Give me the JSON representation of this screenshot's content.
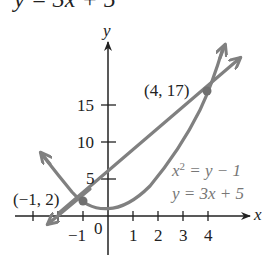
{
  "header": {
    "equation_cropped": "y = 3x + 5"
  },
  "graph": {
    "axes": {
      "x_label": "x",
      "y_label": "y",
      "x_ticks": [
        "-1",
        "0",
        "1",
        "2",
        "3",
        "4"
      ],
      "y_ticks": [
        "5",
        "10",
        "15"
      ]
    },
    "points": [
      {
        "label": "(4, 17)",
        "x": 4,
        "y": 17
      },
      {
        "label": "(−1, 2)",
        "x": -1,
        "y": 2
      }
    ],
    "legend": {
      "eq1": "x² = y − 1",
      "eq1_base": "x",
      "eq1_sup": "2",
      "eq1_rest": " = y − 1",
      "eq2": "y = 3x + 5"
    },
    "colors": {
      "curve": "#808080",
      "axis": "#333333",
      "text": "#222222",
      "legend_text": "#777777"
    },
    "tick_text": {
      "neg1": "−1",
      "zero": "0",
      "one": "1",
      "two": "2",
      "three": "3",
      "four": "4",
      "five": "5",
      "ten": "10",
      "fifteen": "15"
    }
  }
}
